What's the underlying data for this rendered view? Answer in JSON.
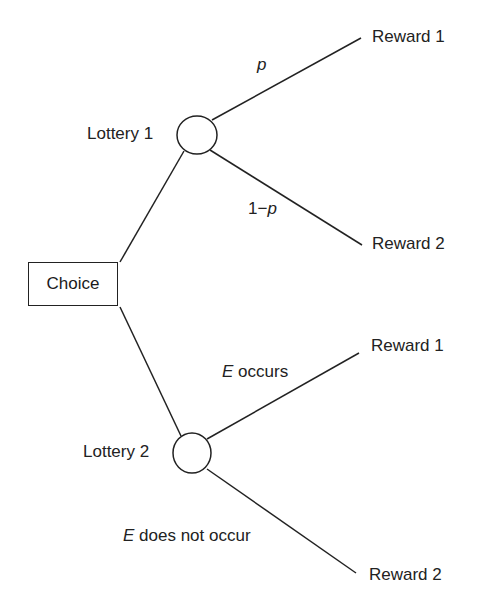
{
  "diagram": {
    "type": "decision-tree",
    "choice_node": {
      "label": "Choice"
    },
    "lotteries": [
      {
        "label": "Lottery 1",
        "branches": [
          {
            "prob_label": "p",
            "outcome": "Reward 1"
          },
          {
            "prob_prefix": "1−",
            "prob_var": "p",
            "outcome": "Reward 2"
          }
        ]
      },
      {
        "label": "Lottery 2",
        "branches": [
          {
            "event_var": "E",
            "event_text": " occurs",
            "outcome": "Reward 1"
          },
          {
            "event_var": "E",
            "event_text": " does not occur",
            "outcome": "Reward 2"
          }
        ]
      }
    ],
    "colors": {
      "line": "#222222",
      "text": "#222222",
      "background": "#ffffff"
    }
  }
}
